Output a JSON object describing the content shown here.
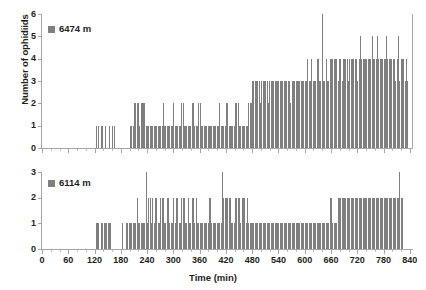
{
  "figure": {
    "xlabel": "Time (min)",
    "ylabel": "Number of ophidiids",
    "bar_color": "#7f7f7f",
    "axis_color": "#a6a6a6"
  },
  "chart_data": [
    {
      "type": "bar",
      "title": "",
      "panel": "top",
      "legend": [
        "6474 m"
      ],
      "legend_position": "top-left",
      "xlabel": "",
      "ylabel": "Number of ophidiids",
      "xlim": [
        0,
        845
      ],
      "ylim": [
        0,
        6
      ],
      "yticks": [
        0,
        1,
        2,
        3,
        4,
        5,
        6
      ],
      "xticks": [
        0,
        60,
        120,
        180,
        240,
        300,
        360,
        420,
        480,
        540,
        600,
        660,
        720,
        780,
        840
      ],
      "xtick_labels": [
        "0",
        "60",
        "120",
        "180",
        "240",
        "300",
        "360",
        "420",
        "480",
        "540",
        "600",
        "660",
        "720",
        "780",
        "840"
      ],
      "ytick_labels": [
        "0",
        "1",
        "2",
        "3",
        "4",
        "5",
        "6"
      ],
      "grid": false,
      "bin_width": 3,
      "x": [
        0,
        3,
        6,
        9,
        12,
        15,
        18,
        21,
        24,
        27,
        30,
        33,
        36,
        39,
        42,
        45,
        48,
        51,
        54,
        57,
        60,
        63,
        66,
        69,
        72,
        75,
        78,
        81,
        84,
        87,
        90,
        93,
        96,
        99,
        102,
        105,
        108,
        111,
        114,
        117,
        120,
        123,
        126,
        129,
        132,
        135,
        138,
        141,
        144,
        147,
        150,
        153,
        156,
        159,
        162,
        165,
        168,
        171,
        174,
        177,
        180,
        183,
        186,
        189,
        192,
        195,
        198,
        201,
        204,
        207,
        210,
        213,
        216,
        219,
        222,
        225,
        228,
        231,
        234,
        237,
        240,
        243,
        246,
        249,
        252,
        255,
        258,
        261,
        264,
        267,
        270,
        273,
        276,
        279,
        282,
        285,
        288,
        291,
        294,
        297,
        300,
        303,
        306,
        309,
        312,
        315,
        318,
        321,
        324,
        327,
        330,
        333,
        336,
        339,
        342,
        345,
        348,
        351,
        354,
        357,
        360,
        363,
        366,
        369,
        372,
        375,
        378,
        381,
        384,
        387,
        390,
        393,
        396,
        399,
        402,
        405,
        408,
        411,
        414,
        417,
        420,
        423,
        426,
        429,
        432,
        435,
        438,
        441,
        444,
        447,
        450,
        453,
        456,
        459,
        462,
        465,
        468,
        471,
        474,
        477,
        480,
        483,
        486,
        489,
        492,
        495,
        498,
        501,
        504,
        507,
        510,
        513,
        516,
        519,
        522,
        525,
        528,
        531,
        534,
        537,
        540,
        543,
        546,
        549,
        552,
        555,
        558,
        561,
        564,
        567,
        570,
        573,
        576,
        579,
        582,
        585,
        588,
        591,
        594,
        597,
        600,
        603,
        606,
        609,
        612,
        615,
        618,
        621,
        624,
        627,
        630,
        633,
        636,
        639,
        642,
        645,
        648,
        651,
        654,
        657,
        660,
        663,
        666,
        669,
        672,
        675,
        678,
        681,
        684,
        687,
        690,
        693,
        696,
        699,
        702,
        705,
        708,
        711,
        714,
        717,
        720,
        723,
        726,
        729,
        732,
        735,
        738,
        741,
        744,
        747,
        750,
        753,
        756,
        759,
        762,
        765,
        768,
        771,
        774,
        777,
        780,
        783,
        786,
        789,
        792,
        795,
        798,
        801,
        804,
        807,
        810,
        813,
        816,
        819,
        822,
        825,
        828,
        831,
        834,
        837,
        840
      ],
      "values": [
        0,
        0,
        0,
        0,
        0,
        0,
        0,
        0,
        0,
        0,
        0,
        0,
        0,
        0,
        0,
        0,
        0,
        0,
        0,
        0,
        0,
        0,
        0,
        0,
        0,
        0,
        0,
        0,
        0,
        0,
        0,
        0,
        0,
        0,
        0,
        0,
        0,
        0,
        0,
        0,
        0,
        1,
        0,
        1,
        0,
        1,
        1,
        0,
        1,
        0,
        0,
        1,
        0,
        1,
        0,
        1,
        0,
        0,
        0,
        0,
        0,
        0,
        0,
        0,
        0,
        0,
        0,
        1,
        1,
        1,
        2,
        2,
        2,
        2,
        1,
        2,
        2,
        2,
        2,
        1,
        1,
        1,
        1,
        1,
        1,
        1,
        1,
        1,
        1,
        1,
        1,
        1,
        2,
        1,
        1,
        1,
        1,
        1,
        1,
        1,
        2,
        1,
        1,
        1,
        1,
        1,
        2,
        2,
        1,
        1,
        1,
        1,
        1,
        1,
        2,
        2,
        1,
        1,
        1,
        2,
        2,
        1,
        1,
        1,
        1,
        1,
        1,
        1,
        1,
        1,
        1,
        1,
        1,
        1,
        1,
        2,
        1,
        1,
        1,
        1,
        2,
        2,
        1,
        1,
        1,
        1,
        1,
        2,
        2,
        2,
        1,
        1,
        1,
        1,
        1,
        1,
        1,
        2,
        2,
        2,
        3,
        3,
        3,
        3,
        3,
        3,
        2,
        3,
        3,
        3,
        3,
        3,
        2,
        3,
        3,
        3,
        3,
        3,
        3,
        3,
        3,
        3,
        3,
        3,
        3,
        3,
        3,
        3,
        3,
        2,
        3,
        3,
        3,
        3,
        3,
        3,
        3,
        3,
        3,
        3,
        3,
        3,
        4,
        3,
        3,
        4,
        3,
        3,
        3,
        4,
        4,
        3,
        3,
        6,
        3,
        3,
        4,
        3,
        3,
        4,
        4,
        4,
        4,
        4,
        4,
        3,
        4,
        4,
        3,
        4,
        4,
        4,
        4,
        3,
        4,
        4,
        4,
        4,
        4,
        4,
        3,
        4,
        5,
        4,
        4,
        4,
        4,
        4,
        4,
        4,
        4,
        5,
        4,
        4,
        4,
        5,
        4,
        4,
        4,
        4,
        4,
        4,
        5,
        4,
        4,
        4,
        4,
        4,
        4,
        3,
        4,
        5,
        3,
        4,
        4,
        4,
        3,
        4,
        3
      ]
    },
    {
      "type": "bar",
      "title": "",
      "panel": "bottom",
      "legend": [
        "6114 m"
      ],
      "legend_position": "top-left",
      "xlabel": "Time (min)",
      "ylabel": "",
      "xlim": [
        0,
        845
      ],
      "ylim": [
        0,
        3
      ],
      "yticks": [
        0,
        1,
        2,
        3
      ],
      "xticks": [
        0,
        60,
        120,
        180,
        240,
        300,
        360,
        420,
        480,
        540,
        600,
        660,
        720,
        780,
        840
      ],
      "xtick_labels": [
        "0",
        "60",
        "120",
        "180",
        "240",
        "300",
        "360",
        "420",
        "480",
        "540",
        "600",
        "660",
        "720",
        "780",
        "840"
      ],
      "ytick_labels": [
        "0",
        "1",
        "2",
        "3"
      ],
      "grid": false,
      "bin_width": 3,
      "x": [
        0,
        3,
        6,
        9,
        12,
        15,
        18,
        21,
        24,
        27,
        30,
        33,
        36,
        39,
        42,
        45,
        48,
        51,
        54,
        57,
        60,
        63,
        66,
        69,
        72,
        75,
        78,
        81,
        84,
        87,
        90,
        93,
        96,
        99,
        102,
        105,
        108,
        111,
        114,
        117,
        120,
        123,
        126,
        129,
        132,
        135,
        138,
        141,
        144,
        147,
        150,
        153,
        156,
        159,
        162,
        165,
        168,
        171,
        174,
        177,
        180,
        183,
        186,
        189,
        192,
        195,
        198,
        201,
        204,
        207,
        210,
        213,
        216,
        219,
        222,
        225,
        228,
        231,
        234,
        237,
        240,
        243,
        246,
        249,
        252,
        255,
        258,
        261,
        264,
        267,
        270,
        273,
        276,
        279,
        282,
        285,
        288,
        291,
        294,
        297,
        300,
        303,
        306,
        309,
        312,
        315,
        318,
        321,
        324,
        327,
        330,
        333,
        336,
        339,
        342,
        345,
        348,
        351,
        354,
        357,
        360,
        363,
        366,
        369,
        372,
        375,
        378,
        381,
        384,
        387,
        390,
        393,
        396,
        399,
        402,
        405,
        408,
        411,
        414,
        417,
        420,
        423,
        426,
        429,
        432,
        435,
        438,
        441,
        444,
        447,
        450,
        453,
        456,
        459,
        462,
        465,
        468,
        471,
        474,
        477,
        480,
        483,
        486,
        489,
        492,
        495,
        498,
        501,
        504,
        507,
        510,
        513,
        516,
        519,
        522,
        525,
        528,
        531,
        534,
        537,
        540,
        543,
        546,
        549,
        552,
        555,
        558,
        561,
        564,
        567,
        570,
        573,
        576,
        579,
        582,
        585,
        588,
        591,
        594,
        597,
        600,
        603,
        606,
        609,
        612,
        615,
        618,
        621,
        624,
        627,
        630,
        633,
        636,
        639,
        642,
        645,
        648,
        651,
        654,
        657,
        660,
        663,
        666,
        669,
        672,
        675,
        678,
        681,
        684,
        687,
        690,
        693,
        696,
        699,
        702,
        705,
        708,
        711,
        714,
        717,
        720,
        723,
        726,
        729,
        732,
        735,
        738,
        741,
        744,
        747,
        750,
        753,
        756,
        759,
        762,
        765,
        768,
        771,
        774,
        777,
        780,
        783,
        786,
        789,
        792,
        795,
        798,
        801,
        804,
        807,
        810,
        813,
        816,
        819,
        822,
        825,
        828,
        831,
        834,
        837,
        840
      ],
      "values": [
        0,
        0,
        0,
        0,
        0,
        0,
        0,
        0,
        0,
        0,
        0,
        0,
        0,
        0,
        0,
        0,
        0,
        0,
        0,
        0,
        0,
        0,
        0,
        0,
        0,
        0,
        0,
        0,
        0,
        0,
        0,
        0,
        0,
        0,
        0,
        0,
        0,
        0,
        0,
        0,
        0,
        1,
        1,
        1,
        0,
        1,
        1,
        1,
        1,
        1,
        1,
        1,
        1,
        0,
        0,
        0,
        0,
        0,
        0,
        0,
        0,
        1,
        0,
        0,
        1,
        1,
        1,
        1,
        1,
        1,
        1,
        1,
        2,
        1,
        1,
        1,
        1,
        1,
        1,
        3,
        1,
        2,
        2,
        1,
        2,
        1,
        2,
        2,
        1,
        1,
        2,
        2,
        2,
        1,
        1,
        2,
        2,
        1,
        1,
        1,
        2,
        1,
        2,
        2,
        1,
        1,
        2,
        2,
        2,
        1,
        1,
        2,
        1,
        1,
        2,
        2,
        1,
        2,
        1,
        1,
        1,
        1,
        1,
        1,
        1,
        1,
        1,
        2,
        2,
        1,
        1,
        1,
        1,
        1,
        1,
        1,
        1,
        3,
        2,
        2,
        2,
        2,
        2,
        2,
        1,
        1,
        1,
        2,
        2,
        2,
        2,
        1,
        2,
        2,
        2,
        1,
        2,
        1,
        1,
        1,
        1,
        1,
        1,
        1,
        1,
        1,
        1,
        1,
        1,
        1,
        1,
        1,
        1,
        1,
        1,
        1,
        1,
        1,
        1,
        1,
        1,
        1,
        1,
        1,
        1,
        1,
        1,
        1,
        1,
        1,
        1,
        1,
        1,
        1,
        1,
        1,
        1,
        1,
        1,
        1,
        1,
        1,
        1,
        1,
        1,
        1,
        1,
        1,
        1,
        1,
        1,
        1,
        1,
        1,
        1,
        1,
        1,
        1,
        1,
        2,
        2,
        1,
        1,
        1,
        1,
        2,
        2,
        2,
        2,
        2,
        2,
        2,
        2,
        2,
        2,
        2,
        2,
        2,
        2,
        2,
        2,
        2,
        2,
        2,
        2,
        2,
        2,
        2,
        2,
        2,
        2,
        2,
        2,
        2,
        2,
        2,
        2,
        2,
        2,
        2,
        2,
        2,
        2,
        2,
        2,
        2,
        2,
        2,
        2,
        2,
        2,
        2,
        3,
        2,
        2
      ]
    }
  ]
}
